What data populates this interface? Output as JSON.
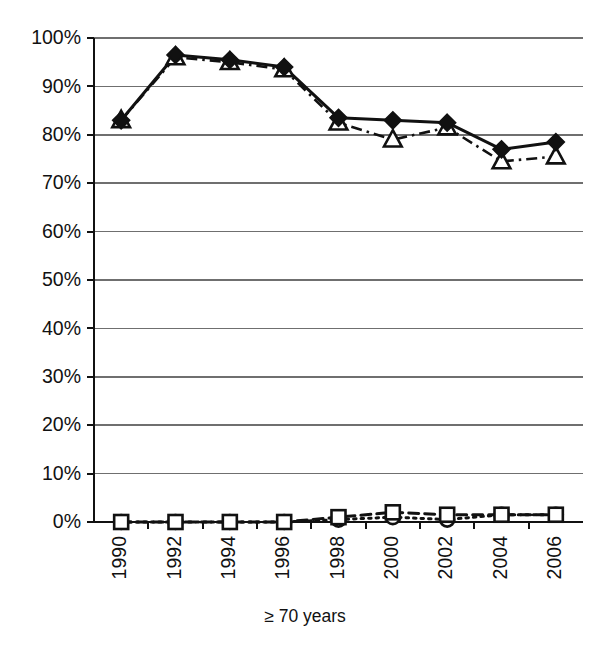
{
  "chart_data": {
    "type": "line",
    "title": "",
    "subtitle": "",
    "xlabel": "≥ 70 years",
    "ylabel": "",
    "x": [
      1990,
      1992,
      1994,
      1996,
      1998,
      2000,
      2002,
      2004,
      2006
    ],
    "categories": [
      "1990",
      "1992",
      "1994",
      "1996",
      "1998",
      "2000",
      "2002",
      "2004",
      "2006"
    ],
    "xtick_labels": [
      "1990",
      "1992",
      "1994",
      "1996",
      "1998",
      "2000",
      "2002",
      "2004",
      "2006"
    ],
    "xtick_rotation": 90,
    "ytick_labels": [
      "0%",
      "10%",
      "20%",
      "30%",
      "40%",
      "50%",
      "60%",
      "70%",
      "80%",
      "90%",
      "100%"
    ],
    "ytick_values": [
      0,
      10,
      20,
      30,
      40,
      50,
      60,
      70,
      80,
      90,
      100
    ],
    "ylim": [
      0,
      100
    ],
    "xlim": [
      1989,
      2007
    ],
    "grid": "horizontal",
    "legend": "none",
    "series": [
      {
        "name": "upper-filled-diamond",
        "marker": "filled-diamond",
        "line_style": "solid",
        "color": "#111111",
        "values": [
          83.0,
          96.5,
          95.5,
          94.0,
          83.5,
          83.0,
          82.5,
          77.0,
          78.5
        ]
      },
      {
        "name": "upper-open-triangle",
        "marker": "open-triangle",
        "line_style": "dash-dot",
        "color": "#111111",
        "values": [
          83.0,
          96.0,
          95.0,
          93.5,
          82.5,
          79.0,
          81.5,
          74.5,
          75.5
        ]
      },
      {
        "name": "lower-open-square",
        "marker": "open-square",
        "line_style": "dashed",
        "color": "#111111",
        "values": [
          0.0,
          0.0,
          0.0,
          0.0,
          1.0,
          2.0,
          1.5,
          1.5,
          1.5
        ]
      },
      {
        "name": "lower-open-circle",
        "marker": "open-circle",
        "line_style": "dotted",
        "color": "#111111",
        "values": [
          0.0,
          0.0,
          0.0,
          0.0,
          0.5,
          1.0,
          0.5,
          1.5,
          1.5
        ]
      }
    ]
  },
  "axes": {
    "x_axis_title": "≥ 70 years"
  }
}
